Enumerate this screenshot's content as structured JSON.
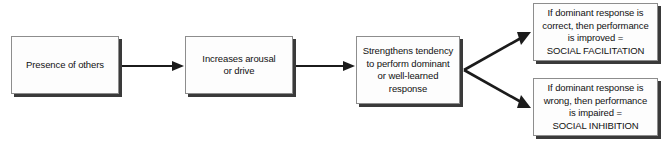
{
  "diagram": {
    "background_color": "#ffffff",
    "line_color": "#1b1b1b",
    "box_fill_color": "#fdfdfd",
    "box_border_color": "#8d8d8d",
    "box_shadow_color": "#3a3a3a",
    "nodes": [
      {
        "id": "presence",
        "label": "Presence of others"
      },
      {
        "id": "arousal",
        "label": "Increases arousal\nor drive"
      },
      {
        "id": "tendency",
        "label": "Strengthens tendency\nto perform dominant\nor well-learned\nresponse"
      },
      {
        "id": "facilitation",
        "label": "If dominant response is\ncorrect, then performance\nis improved =\nSOCIAL FACILITATION"
      },
      {
        "id": "inhibition",
        "label": "If dominant response is\nwrong, then performance\nis impaired =\nSOCIAL INHIBITION"
      }
    ],
    "connectors": [
      {
        "id": "presence-to-arousal",
        "from": "presence",
        "to": "arousal",
        "style": "straight-right"
      },
      {
        "id": "arousal-to-tendency",
        "from": "arousal",
        "to": "tendency",
        "style": "straight-right"
      },
      {
        "id": "tendency-to-facilitation",
        "from": "tendency",
        "to": "facilitation",
        "style": "diagonal-up-right"
      },
      {
        "id": "tendency-to-inhibition",
        "from": "tendency",
        "to": "inhibition",
        "style": "diagonal-down-right"
      }
    ]
  }
}
